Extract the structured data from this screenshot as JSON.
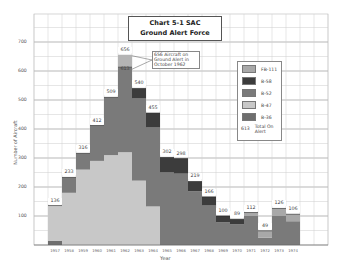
{
  "chart_data": {
    "type": "bar",
    "stacked": true,
    "title": "Chart 5-1 SAC Ground Alert Force",
    "title_lines": [
      "Chart 5-1 SAC",
      "Ground Alert Force"
    ],
    "xlabel": "Year",
    "ylabel": "Number of Aircraft",
    "ylim": [
      0,
      800
    ],
    "yticks": [
      100,
      200,
      300,
      400,
      500,
      600,
      700
    ],
    "grid": true,
    "legend_position": "right-inside",
    "categories": [
      "1957",
      "1958",
      "1959",
      "1960",
      "1961",
      "1962",
      "1963",
      "1964",
      "1965",
      "1966",
      "1967",
      "1968",
      "1969",
      "1970",
      "1971",
      "1972",
      "1973",
      "1974"
    ],
    "series": [
      {
        "name": "B-36",
        "color": "#6e6e6e",
        "values": [
          15,
          0,
          0,
          0,
          0,
          0,
          0,
          0,
          0,
          0,
          0,
          0,
          0,
          0,
          0,
          0,
          0,
          0
        ]
      },
      {
        "name": "B-47",
        "color": "#c8c8c8",
        "values": [
          121,
          180,
          260,
          290,
          310,
          320,
          222,
          133,
          0,
          0,
          0,
          0,
          0,
          0,
          0,
          0,
          0,
          0
        ]
      },
      {
        "name": "B-52",
        "color": "#7a7a7a",
        "values": [
          0,
          53,
          56,
          122,
          199,
          293,
          283,
          272,
          250,
          246,
          185,
          136,
          78,
          72,
          100,
          25,
          100,
          82
        ]
      },
      {
        "name": "B-58",
        "color": "#3c3c3c",
        "values": [
          0,
          0,
          0,
          0,
          0,
          0,
          35,
          50,
          52,
          52,
          34,
          30,
          22,
          17,
          0,
          0,
          0,
          0
        ]
      },
      {
        "name": "FB-111",
        "color": "#a8a8a8",
        "values": [
          0,
          0,
          0,
          0,
          0,
          0,
          0,
          0,
          0,
          0,
          0,
          0,
          0,
          0,
          12,
          24,
          26,
          24
        ]
      }
    ],
    "totals": [
      136,
      233,
      316,
      412,
      509,
      613,
      540,
      455,
      302,
      298,
      219,
      166,
      100,
      89,
      112,
      49,
      126,
      106
    ],
    "surge": {
      "year": "1962",
      "normal_total": 613,
      "peak_total": 656,
      "color": "#b4b4b4"
    },
    "annotation": "656 Aircraft on Ground Alert in October 1962",
    "legend_note": {
      "sample_value": "613",
      "label": "Total On Alert"
    }
  },
  "title_line1": "Chart 5-1 SAC",
  "title_line2": "Ground Alert Force",
  "annotation_lines": [
    "656 Aircraft on",
    "Ground Alert in",
    "October 1962"
  ],
  "legend": [
    {
      "label": "FB-111",
      "color": "#a8a8a8"
    },
    {
      "label": "B-58",
      "color": "#3c3c3c"
    },
    {
      "label": "B-52",
      "color": "#7a7a7a"
    },
    {
      "label": "B-47",
      "color": "#c8c8c8"
    },
    {
      "label": "B-36",
      "color": "#6e6e6e"
    }
  ],
  "legend_total_value": "613",
  "legend_total_label1": "Total On",
  "legend_total_label2": "Alert",
  "xlabel": "Year",
  "ylabel": "Number of Aircraft"
}
